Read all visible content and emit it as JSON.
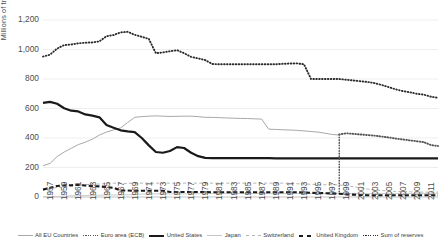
{
  "chart_data": {
    "type": "line",
    "title": "",
    "xlabel": "",
    "ylabel": "Millions of troy ounces",
    "ylim": [
      0,
      1200
    ],
    "ytick_values": [
      0,
      200,
      400,
      600,
      800,
      1000,
      1200
    ],
    "ytick_labels": [
      "0",
      "200",
      "400",
      "600",
      "800",
      "1,000",
      "1,200"
    ],
    "grid": true,
    "legend_position": "bottom",
    "xlim": [
      1957,
      2013
    ],
    "x": [
      1957,
      1958,
      1959,
      1960,
      1961,
      1962,
      1963,
      1964,
      1965,
      1966,
      1967,
      1968,
      1969,
      1970,
      1971,
      1972,
      1973,
      1974,
      1975,
      1976,
      1977,
      1978,
      1979,
      1980,
      1981,
      1982,
      1983,
      1984,
      1985,
      1986,
      1987,
      1988,
      1989,
      1990,
      1991,
      1992,
      1993,
      1994,
      1995,
      1996,
      1997,
      1998,
      1999,
      2000,
      2001,
      2002,
      2003,
      2004,
      2005,
      2006,
      2007,
      2008,
      2009,
      2010,
      2011,
      2012,
      2013
    ],
    "xtick_labels": [
      "1957",
      "1959",
      "1961",
      "1963",
      "1965",
      "1967",
      "1969",
      "1971",
      "1973",
      "1975",
      "1977",
      "1979",
      "1981",
      "1983",
      "1985",
      "1987",
      "1989",
      "1991",
      "1993",
      "1995",
      "1997",
      "1999",
      "2001",
      "2003",
      "2005",
      "2007",
      "2009",
      "2011",
      "2013"
    ],
    "series": [
      {
        "name": "All EU Countries",
        "style": "solid-light",
        "color": "#a8a8a8",
        "values": [
          212,
          228,
          274,
          305,
          330,
          355,
          372,
          392,
          420,
          440,
          455,
          468,
          505,
          540,
          545,
          548,
          550,
          548,
          546,
          547,
          548,
          548,
          545,
          540,
          540,
          538,
          536,
          534,
          533,
          532,
          530,
          528,
          460,
          458,
          456,
          454,
          452,
          448,
          444,
          440,
          432,
          424,
          420,
          null,
          null,
          null,
          null,
          null,
          null,
          null,
          null,
          null,
          null,
          null,
          null,
          null,
          null
        ]
      },
      {
        "name": "Euro area (ECB)",
        "style": "dotted-thick",
        "color": "#555555",
        "values": [
          null,
          null,
          null,
          null,
          null,
          null,
          null,
          null,
          null,
          null,
          null,
          null,
          null,
          null,
          null,
          null,
          null,
          null,
          null,
          null,
          null,
          null,
          null,
          null,
          null,
          null,
          null,
          null,
          null,
          null,
          null,
          null,
          null,
          null,
          null,
          null,
          null,
          null,
          null,
          null,
          null,
          null,
          424,
          432,
          428,
          424,
          420,
          416,
          410,
          404,
          396,
          390,
          384,
          378,
          372,
          352,
          346
        ]
      },
      {
        "name": "United States",
        "style": "solid-thick",
        "color": "#1a1a1a",
        "values": [
          638,
          645,
          632,
          602,
          585,
          580,
          560,
          552,
          540,
          488,
          470,
          452,
          445,
          440,
          400,
          350,
          305,
          300,
          312,
          338,
          332,
          300,
          277,
          265,
          264,
          264,
          264,
          264,
          264,
          263,
          263,
          263,
          263,
          262,
          262,
          262,
          262,
          262,
          262,
          262,
          262,
          262,
          262,
          262,
          262,
          262,
          262,
          262,
          262,
          262,
          262,
          262,
          262,
          262,
          262,
          262,
          262
        ]
      },
      {
        "name": "Japan",
        "style": "solid-vlight",
        "color": "#c6c6c6",
        "values": [
          2,
          3,
          4,
          6,
          8,
          9,
          10,
          11,
          12,
          14,
          14,
          14,
          15,
          16,
          20,
          21,
          21,
          21,
          21,
          21,
          21,
          22,
          23,
          24,
          24,
          24,
          24,
          24,
          24,
          24,
          24,
          24,
          24,
          24,
          24,
          24,
          24,
          24,
          24,
          24,
          24,
          24,
          24,
          24,
          24,
          24,
          24,
          24,
          24,
          24,
          24,
          24,
          24,
          24,
          24,
          24,
          24
        ]
      },
      {
        "name": "Switzerland",
        "style": "dashed-light",
        "color": "#b4b4b4",
        "values": [
          48,
          58,
          64,
          68,
          72,
          78,
          84,
          86,
          88,
          92,
          94,
          92,
          92,
          94,
          94,
          94,
          94,
          94,
          94,
          94,
          94,
          94,
          94,
          94,
          94,
          94,
          94,
          94,
          94,
          94,
          94,
          94,
          94,
          94,
          94,
          94,
          90,
          88,
          86,
          84,
          83,
          83,
          82,
          77,
          70,
          62,
          54,
          48,
          44,
          41,
          38,
          37,
          35,
          34,
          33,
          33,
          33
        ]
      },
      {
        "name": "United Kingdom",
        "style": "dashed-thick",
        "color": "#1a1a1a",
        "values": [
          50,
          62,
          75,
          78,
          80,
          82,
          78,
          74,
          72,
          68,
          62,
          44,
          44,
          42,
          42,
          42,
          42,
          42,
          34,
          34,
          34,
          34,
          34,
          34,
          32,
          32,
          32,
          32,
          32,
          32,
          32,
          32,
          32,
          32,
          32,
          32,
          32,
          30,
          28,
          27,
          26,
          24,
          22,
          18,
          16,
          14,
          12,
          12,
          12,
          12,
          12,
          12,
          12,
          12,
          12,
          12,
          12
        ]
      },
      {
        "name": "Sum of reserves",
        "style": "dotted",
        "color": "#2b2b2b",
        "values": [
          952,
          965,
          1006,
          1030,
          1034,
          1042,
          1046,
          1048,
          1055,
          1090,
          1098,
          1116,
          1120,
          1100,
          1086,
          1072,
          975,
          980,
          988,
          995,
          975,
          950,
          940,
          928,
          902,
          900,
          900,
          900,
          900,
          900,
          900,
          900,
          900,
          900,
          903,
          905,
          906,
          900,
          800,
          800,
          800,
          800,
          800,
          795,
          790,
          785,
          780,
          772,
          760,
          745,
          730,
          718,
          710,
          700,
          694,
          680,
          672
        ]
      }
    ]
  },
  "legend": {
    "items": [
      {
        "label": "All EU Countries",
        "key": "line-solid-light-key"
      },
      {
        "label": "Euro area (ECB)",
        "key": "line-dotted-thick-key"
      },
      {
        "label": "United States",
        "key": "line-solid-thick-key"
      },
      {
        "label": "Japan",
        "key": "line-solid-vlight-key"
      },
      {
        "label": "Switzerland",
        "key": "line-dashed-light-key"
      },
      {
        "label": "United Kingdom",
        "key": "line-dashed-thick-key"
      },
      {
        "label": "Sum of reserves",
        "key": "line-dotted-key"
      }
    ]
  }
}
